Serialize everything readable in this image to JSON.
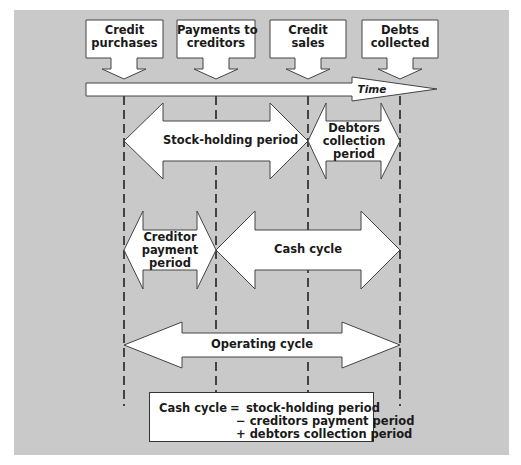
{
  "events": [
    {
      "label_line1": "Credit",
      "label_line2": "purchases",
      "x": 124
    },
    {
      "label_line1": "Payments to",
      "label_line2": "creditors",
      "x": 216
    },
    {
      "label_line1": "Credit",
      "label_line2": "sales",
      "x": 308
    },
    {
      "label_line1": "Debts",
      "label_line2": "collected",
      "x": 400
    }
  ],
  "timeline": {
    "label": "Time"
  },
  "periods": {
    "stock_holding": {
      "label": "Stock-holding period"
    },
    "debtors_collection": {
      "line1": "Debtors",
      "line2": "collection",
      "line3": "period"
    },
    "creditor_payment": {
      "line1": "Creditor",
      "line2": "payment",
      "line3": "period"
    },
    "cash_cycle": {
      "label": "Cash cycle"
    },
    "operating_cycle": {
      "label": "Operating cycle"
    }
  },
  "formula": {
    "lhs": "Cash cycle",
    "equals": "=",
    "term1": "stock-holding period",
    "term2": "− creditors payment period",
    "term3": "+ debtors collection period"
  },
  "colors": {
    "panel": "#c9c9c9",
    "shape_fill": "#ffffff",
    "stroke": "#333333",
    "text": "#1a1a1a"
  }
}
